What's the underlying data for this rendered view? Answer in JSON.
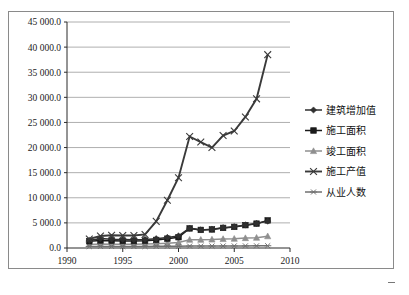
{
  "chart_data": {
    "type": "line",
    "title": "",
    "xlabel": "",
    "ylabel": "",
    "xlim": [
      1990,
      2010
    ],
    "ylim": [
      0,
      45000
    ],
    "grid": true,
    "legend_position": "right",
    "x": [
      1992,
      1993,
      1994,
      1995,
      1996,
      1997,
      1998,
      1999,
      2000,
      2001,
      2002,
      2003,
      2004,
      2005,
      2006,
      2007,
      2008
    ],
    "xticks": [
      "1990",
      "1995",
      "2000",
      "2005",
      "2010"
    ],
    "xtick_values": [
      1990,
      1995,
      2000,
      2005,
      2010
    ],
    "yticks": [
      "0.0",
      "5 000.0",
      "10 000.0",
      "15 000.0",
      "20 000.0",
      "25 000.0",
      "30 000.0",
      "35 000.0",
      "40 000.0",
      "45 000.0"
    ],
    "ytick_values": [
      0,
      5000,
      10000,
      15000,
      20000,
      25000,
      30000,
      35000,
      40000,
      45000
    ],
    "series": [
      {
        "name": "建筑增加值",
        "marker": "diamond",
        "color": "#2f2f2f",
        "values": [
          1500,
          1900,
          1750,
          1700,
          1650,
          1700,
          1850,
          2100,
          2400,
          3950,
          3600,
          3750,
          4050,
          4250,
          4600,
          4900,
          5350
        ]
      },
      {
        "name": "施工面积",
        "marker": "square",
        "color": "#1a1a1a",
        "values": [
          1350,
          1500,
          1450,
          1400,
          1400,
          1450,
          1600,
          1850,
          2150,
          3900,
          3600,
          3700,
          4000,
          4200,
          4550,
          4850,
          5500
        ]
      },
      {
        "name": "竣工面积",
        "marker": "triangle",
        "color": "#8f8f8f",
        "values": [
          700,
          780,
          760,
          740,
          760,
          800,
          860,
          960,
          1100,
          1650,
          1650,
          1700,
          1800,
          1850,
          1980,
          2050,
          2350
        ]
      },
      {
        "name": "施工产值",
        "marker": "x",
        "color": "#3a3a3a",
        "values": [
          1800,
          2400,
          2550,
          2500,
          2500,
          2700,
          5300,
          9500,
          14000,
          22200,
          21100,
          20000,
          22400,
          23300,
          26100,
          29700,
          38500
        ]
      },
      {
        "name": "从业人数",
        "marker": "asterisk",
        "color": "#707070",
        "values": [
          300,
          320,
          310,
          300,
          300,
          310,
          330,
          350,
          360,
          380,
          380,
          390,
          400,
          410,
          420,
          430,
          450
        ]
      }
    ]
  },
  "legend": {
    "items": [
      {
        "label": "建筑增加值"
      },
      {
        "label": "施工面积"
      },
      {
        "label": "竣工面积"
      },
      {
        "label": "施工产值"
      },
      {
        "label": "从业人数"
      }
    ]
  }
}
